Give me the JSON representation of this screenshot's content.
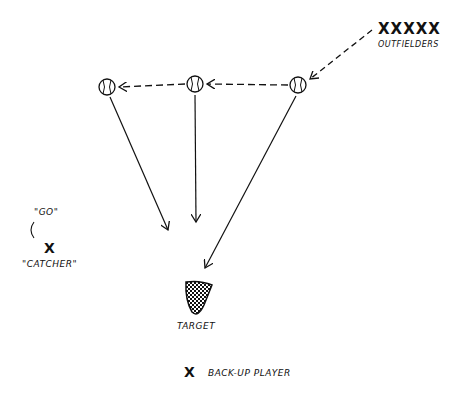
{
  "diagram": {
    "type": "baseball drill diagram",
    "labels": {
      "outfielders": "OUTFIELDERS",
      "outfielder_marks": "XXXXX",
      "go": "\"GO\"",
      "catcher": "\"CATCHER\"",
      "catcher_mark": "X",
      "target": "TARGET",
      "backup_mark": "X",
      "backup": "BACK-UP PLAYER"
    },
    "balls": [
      {
        "id": "ball-left",
        "x": 107,
        "y": 87
      },
      {
        "id": "ball-middle",
        "x": 195,
        "y": 84
      },
      {
        "id": "ball-right",
        "x": 298,
        "y": 85
      }
    ],
    "colors": {
      "ink": "#111111",
      "background": "#ffffff"
    }
  }
}
